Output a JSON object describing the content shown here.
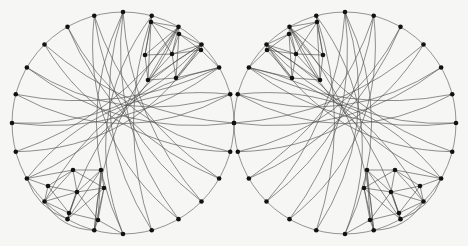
{
  "figure": {
    "type": "graph-drawing-pair",
    "background_color": "#f6f6f4",
    "stroke_color": "#4a4a4a",
    "vertex_color": "#121212",
    "boundary_color": "#555555",
    "vertex_radius": 2.3,
    "edge_width": 0.62,
    "boundary_width": 0.62,
    "caption": ""
  },
  "graphs": [
    {
      "name": "left-graph",
      "label": "",
      "center": [
        123,
        123
      ],
      "radius": 111,
      "mirrored": false,
      "rim_vertex_count": 24,
      "cluster_vertex_count": 12,
      "rim_start_angle_deg": -90,
      "cluster_top": {
        "name": "upper-right-cluster",
        "nodes": [
          [
            151,
            22
          ],
          [
            179,
            34
          ],
          [
            145,
            55
          ],
          [
            172,
            54
          ],
          [
            201,
            50
          ],
          [
            148,
            80
          ],
          [
            176,
            78
          ]
        ],
        "edges": [
          [
            0,
            1
          ],
          [
            0,
            2
          ],
          [
            0,
            3
          ],
          [
            1,
            3
          ],
          [
            1,
            4
          ],
          [
            2,
            3
          ],
          [
            2,
            5
          ],
          [
            3,
            5
          ],
          [
            3,
            6
          ],
          [
            3,
            4
          ],
          [
            4,
            6
          ],
          [
            5,
            6
          ],
          [
            0,
            5
          ],
          [
            1,
            6
          ]
        ]
      },
      "cluster_bottom": {
        "name": "lower-left-cluster",
        "nodes": [
          [
            73,
            170
          ],
          [
            101,
            170
          ],
          [
            48,
            186
          ],
          [
            77,
            192
          ],
          [
            104,
            188
          ],
          [
            69,
            213
          ],
          [
            98,
            220
          ]
        ],
        "edges": [
          [
            0,
            1
          ],
          [
            0,
            2
          ],
          [
            0,
            3
          ],
          [
            1,
            3
          ],
          [
            1,
            4
          ],
          [
            2,
            3
          ],
          [
            3,
            4
          ],
          [
            3,
            5
          ],
          [
            3,
            6
          ],
          [
            5,
            6
          ],
          [
            2,
            5
          ],
          [
            4,
            6
          ],
          [
            0,
            4
          ],
          [
            1,
            6
          ]
        ]
      },
      "chord_sweep_direction": "clockwise",
      "chord_count": 28
    },
    {
      "name": "right-graph",
      "label": "",
      "center": [
        345,
        123
      ],
      "radius": 111,
      "mirrored": true,
      "rim_vertex_count": 24,
      "cluster_vertex_count": 12,
      "rim_start_angle_deg": -90,
      "cluster_top": {
        "name": "upper-left-cluster",
        "nodes": [
          [
            317,
            22
          ],
          [
            289,
            34
          ],
          [
            323,
            55
          ],
          [
            296,
            54
          ],
          [
            267,
            50
          ],
          [
            320,
            80
          ],
          [
            292,
            78
          ]
        ],
        "edges": [
          [
            0,
            1
          ],
          [
            0,
            2
          ],
          [
            0,
            3
          ],
          [
            1,
            3
          ],
          [
            1,
            4
          ],
          [
            2,
            3
          ],
          [
            2,
            5
          ],
          [
            3,
            5
          ],
          [
            3,
            6
          ],
          [
            3,
            4
          ],
          [
            4,
            6
          ],
          [
            5,
            6
          ],
          [
            0,
            5
          ],
          [
            1,
            6
          ]
        ]
      },
      "cluster_bottom": {
        "name": "lower-right-cluster",
        "nodes": [
          [
            395,
            170
          ],
          [
            367,
            170
          ],
          [
            420,
            186
          ],
          [
            391,
            192
          ],
          [
            364,
            188
          ],
          [
            399,
            213
          ],
          [
            370,
            220
          ]
        ],
        "edges": [
          [
            0,
            1
          ],
          [
            0,
            2
          ],
          [
            0,
            3
          ],
          [
            1,
            3
          ],
          [
            1,
            4
          ],
          [
            2,
            3
          ],
          [
            3,
            4
          ],
          [
            3,
            5
          ],
          [
            3,
            6
          ],
          [
            5,
            6
          ],
          [
            2,
            5
          ],
          [
            4,
            6
          ],
          [
            0,
            4
          ],
          [
            1,
            6
          ]
        ]
      },
      "chord_sweep_direction": "counterclockwise",
      "chord_count": 28
    }
  ],
  "chord_pairs_left": [
    [
      0,
      9
    ],
    [
      0,
      10
    ],
    [
      0,
      11
    ],
    [
      1,
      12
    ],
    [
      23,
      8
    ],
    [
      23,
      9
    ],
    [
      22,
      7
    ],
    [
      21,
      7
    ],
    [
      21,
      6
    ],
    [
      20,
      6
    ],
    [
      20,
      5
    ],
    [
      19,
      5
    ],
    [
      19,
      4
    ],
    [
      18,
      4
    ],
    [
      18,
      3
    ],
    [
      17,
      3
    ],
    [
      17,
      2
    ],
    [
      16,
      2
    ],
    [
      16,
      14
    ],
    [
      15,
      13
    ],
    [
      2,
      13
    ],
    [
      3,
      14
    ],
    [
      4,
      15
    ],
    [
      5,
      16
    ],
    [
      1,
      11
    ],
    [
      22,
      8
    ],
    [
      0,
      12
    ],
    [
      23,
      10
    ]
  ],
  "rim_edges_note": "consecutive rim vertices joined by circle arc",
  "legend": {
    "items": []
  },
  "axes": {
    "visible": false
  }
}
